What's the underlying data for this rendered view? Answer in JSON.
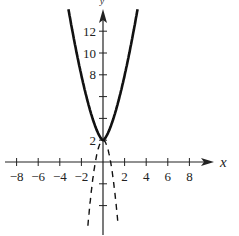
{
  "chart_data": {
    "type": "line",
    "title": "",
    "xlabel": "x",
    "ylabel": "y",
    "xlim": [
      -9,
      10
    ],
    "ylim": [
      -6.5,
      13.5
    ],
    "grid": false,
    "legend": null,
    "x_ticks": [
      -8,
      -6,
      -4,
      -2,
      2,
      4,
      6,
      8
    ],
    "x_tick_labels": [
      "−8",
      "−6",
      "−4",
      "−2",
      "2",
      "4",
      "6",
      "8"
    ],
    "y_ticks": [
      -4,
      -2,
      2,
      4,
      6,
      8,
      10,
      12
    ],
    "y_tick_labels": [
      "",
      "",
      "2",
      "",
      "",
      "8",
      "10",
      "12"
    ],
    "series": [
      {
        "name": "solid-curve",
        "style": "solid",
        "color": "#111111",
        "description": "upward-opening curve with vertex at (0, 2)",
        "x": [
          -3.2,
          -3,
          -2.5,
          -2,
          -1.5,
          -1,
          -0.5,
          0,
          0.5,
          1,
          1.5,
          2,
          2.5,
          3,
          3.2
        ],
        "y": [
          13.0,
          12.9,
          10.3,
          7.9,
          5.9,
          4.1,
          2.7,
          2,
          2.7,
          4.1,
          5.9,
          7.9,
          10.3,
          12.9,
          13.0
        ]
      },
      {
        "name": "dashed-curve",
        "style": "dashed",
        "color": "#111111",
        "description": "steep downward-opening dashed curve with peak near (0, 2)",
        "x": [
          -1.4,
          -1.2,
          -1.0,
          -0.8,
          -0.6,
          -0.4,
          -0.2,
          0,
          0.2,
          0.4,
          0.6,
          0.8,
          1.0,
          1.2,
          1.4
        ],
        "y": [
          -5.8,
          -3.8,
          -2.0,
          -0.6,
          0.6,
          1.4,
          1.8,
          2,
          1.8,
          1.4,
          0.6,
          -0.6,
          -2.0,
          -3.8,
          -5.8
        ]
      }
    ]
  },
  "axes": {
    "x_label": "x",
    "y_label": "y"
  }
}
